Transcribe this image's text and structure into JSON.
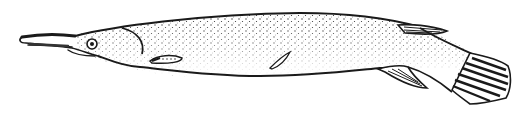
{
  "image": {
    "subject": "Elongated fish illustration (stippled line drawing)",
    "style": "black ink stipple on white",
    "colors": {
      "ink": "#1a1a1a",
      "background": "#ffffff"
    },
    "parts": [
      "snout",
      "eye",
      "gill-cover",
      "pectoral-fin",
      "lateral-mark",
      "dorsal-fin",
      "anal-fin",
      "caudal-fin"
    ]
  }
}
